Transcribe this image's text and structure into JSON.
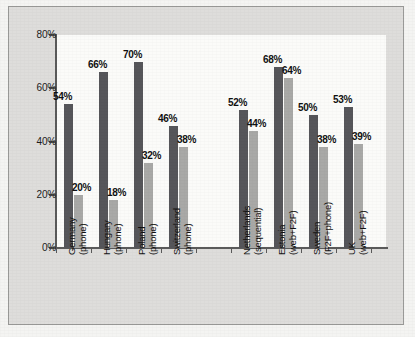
{
  "chart_data": {
    "type": "bar",
    "title": "",
    "subtitle": "",
    "xlabel": "",
    "ylabel": "",
    "ylim": [
      0,
      80
    ],
    "ytick_labels": [
      "0%",
      "20%",
      "40%",
      "60%",
      "80%"
    ],
    "ytick_values": [
      0,
      20,
      40,
      60,
      80
    ],
    "grid": false,
    "legend_position": "none",
    "value_suffix": "%",
    "categories": [
      "Germany (phone)",
      "Hungary (phone)",
      "Poland (phone)",
      "Switzerland (phone)",
      "Netherlands (sequential)",
      "Estonia (web+F2F)",
      "Sweden (F2F+phone)",
      "UK (web+F2F)"
    ],
    "category_lines": [
      {
        "line1": "Germany",
        "line2": "(phone)"
      },
      {
        "line1": "Hungary",
        "line2": "(phone)"
      },
      {
        "line1": "Poland",
        "line2": "(phone)"
      },
      {
        "line1": "Switzerland",
        "line2": "(phone)"
      },
      {
        "line1": "Netherlands",
        "line2": "(sequential)"
      },
      {
        "line1": "Estonia",
        "line2": "(web+F2F)"
      },
      {
        "line1": "Sweden",
        "line2": "(F2F+phone)"
      },
      {
        "line1": "UK",
        "line2": "(web+F2F)"
      }
    ],
    "series": [
      {
        "name": "dark",
        "color": "#56565a",
        "values": [
          54,
          66,
          70,
          46,
          52,
          68,
          50,
          53
        ],
        "labels": [
          "54%",
          "66%",
          "70%",
          "46%",
          "52%",
          "68%",
          "50%",
          "53%"
        ]
      },
      {
        "name": "light",
        "color": "#a9a9a7",
        "values": [
          20,
          18,
          32,
          38,
          44,
          64,
          38,
          39
        ],
        "labels": [
          "20%",
          "18%",
          "32%",
          "38%",
          "44%",
          "64%",
          "38%",
          "39%"
        ]
      }
    ]
  },
  "figure": {
    "background_color": "#dedddb",
    "plot_background_color": "#fbfbf9",
    "axis_color": "#5a5a5a",
    "page_background_color": "#f4f4f2"
  }
}
